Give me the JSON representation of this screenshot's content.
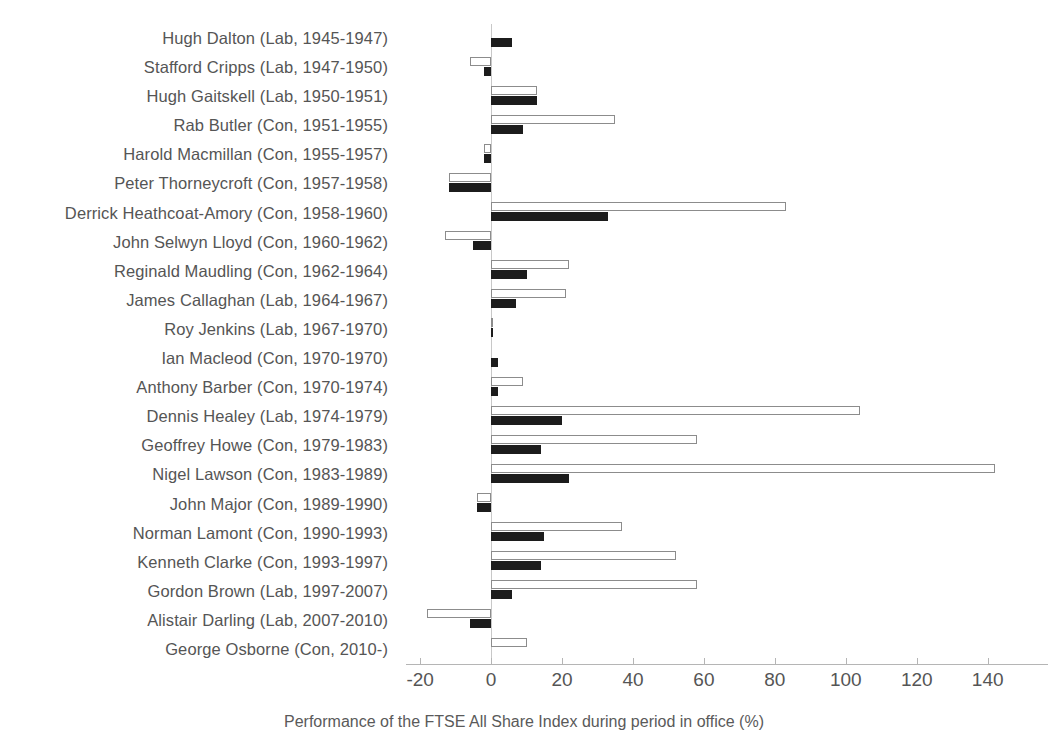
{
  "chart_data": {
    "type": "bar",
    "orientation": "horizontal",
    "title": "",
    "caption": "Performance of the FTSE All Share Index during period in office (%)",
    "xlabel": "Performance of the FTSE All Share Index during period in office (%)",
    "ylabel": "",
    "xlim": [
      -24,
      157
    ],
    "xticks": [
      -20,
      0,
      20,
      40,
      60,
      80,
      100,
      120,
      140
    ],
    "xtick_labels": [
      "-20",
      "0",
      "20",
      "40",
      "60",
      "80",
      "100",
      "120",
      "140"
    ],
    "grid": false,
    "legend": "none",
    "zero_reference_line": true,
    "categories": [
      "Hugh Dalton (Lab, 1945-1947)",
      "Stafford Cripps (Lab, 1947-1950)",
      "Hugh Gaitskell (Lab, 1950-1951)",
      "Rab Butler (Con, 1951-1955)",
      "Harold Macmillan (Con, 1955-1957)",
      "Peter Thorneycroft (Con, 1957-1958)",
      "Derrick Heathcoat-Amory (Con, 1958-1960)",
      "John Selwyn Lloyd (Con, 1960-1962)",
      "Reginald Maudling (Con, 1962-1964)",
      "James Callaghan (Lab, 1964-1967)",
      "Roy Jenkins (Lab, 1967-1970)",
      "Ian Macleod (Con, 1970-1970)",
      "Anthony Barber (Con, 1970-1974)",
      "Dennis Healey (Lab, 1974-1979)",
      "Geoffrey Howe (Con, 1979-1983)",
      "Nigel Lawson (Con, 1983-1989)",
      "John Major (Con, 1989-1990)",
      "Norman Lamont (Con, 1990-1993)",
      "Kenneth Clarke (Con, 1993-1997)",
      "Gordon Brown  (Lab, 1997-2007)",
      "Alistair Darling (Lab, 2007-2010)",
      "George Osborne (Con, 2010-)"
    ],
    "series": [
      {
        "name": "white-series",
        "style": "open-outline",
        "values": [
          0,
          -6,
          13,
          35,
          -2,
          -12,
          83,
          -13,
          22,
          21,
          0.5,
          0,
          9,
          104,
          58,
          142,
          -4,
          37,
          52,
          58,
          -18,
          10
        ]
      },
      {
        "name": "black-series",
        "style": "filled",
        "values": [
          6,
          -2,
          13,
          9,
          -2,
          -12,
          33,
          -5,
          10,
          7,
          0.5,
          2,
          2,
          20,
          14,
          22,
          -4,
          15,
          14,
          6,
          -6,
          0
        ]
      }
    ]
  },
  "colors": {
    "filled_bar": "#1c1c1c",
    "open_bar_fill": "#ffffff",
    "open_bar_stroke": "#8c8c8c",
    "axis": "#b5b5b5",
    "text": "#555555",
    "background": "#ffffff"
  }
}
